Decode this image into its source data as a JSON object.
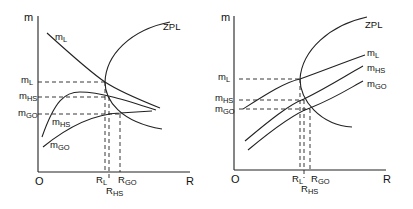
{
  "panels": [
    {
      "id": "left",
      "y_axis_label": "m",
      "x_axis_label": "R",
      "origin_label": "O",
      "curves": {
        "zpl": "ZPL",
        "m_l": {
          "main": "m",
          "sub": "L"
        },
        "m_hs": {
          "main": "m",
          "sub": "HS"
        },
        "m_go": {
          "main": "m",
          "sub": "GO"
        }
      },
      "y_ticks": [
        {
          "main": "m",
          "sub": "L"
        },
        {
          "main": "m",
          "sub": "HS"
        },
        {
          "main": "m",
          "sub": "GO"
        }
      ],
      "x_ticks": [
        {
          "main": "R",
          "sub": "L"
        },
        {
          "main": "R",
          "sub": "HS"
        },
        {
          "main": "R",
          "sub": "GO"
        }
      ]
    },
    {
      "id": "right",
      "y_axis_label": "m",
      "x_axis_label": "R",
      "origin_label": "O",
      "curves": {
        "zpl": "ZPL",
        "m_l": {
          "main": "m",
          "sub": "L"
        },
        "m_hs": {
          "main": "m",
          "sub": "HS"
        },
        "m_go": {
          "main": "m",
          "sub": "GO"
        }
      },
      "y_ticks": [
        {
          "main": "m",
          "sub": "L"
        },
        {
          "main": "m",
          "sub": "HS"
        },
        {
          "main": "m",
          "sub": "GO"
        }
      ],
      "x_ticks": [
        {
          "main": "R",
          "sub": "L"
        },
        {
          "main": "R",
          "sub": "HS"
        },
        {
          "main": "R",
          "sub": "GO"
        }
      ]
    }
  ],
  "colors": {
    "line": "#222222",
    "background": "#ffffff"
  }
}
